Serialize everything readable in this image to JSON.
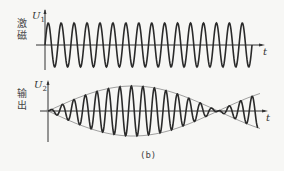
{
  "figure": {
    "caption": "(b)",
    "panels": [
      {
        "side_label": "激磁",
        "y_axis_label": "U",
        "y_axis_sub": "1",
        "x_axis_label": "t",
        "description": "constant-amplitude sinusoid (excitation)"
      },
      {
        "side_label": "输出",
        "y_axis_label": "U",
        "y_axis_sub": "2",
        "x_axis_label": "t",
        "description": "amplitude-modulated sinusoid with dashed envelope (output)"
      }
    ]
  },
  "colors": {
    "line": "#2a2a2a",
    "envelope": "#888888",
    "background": "#f7f7f5"
  }
}
